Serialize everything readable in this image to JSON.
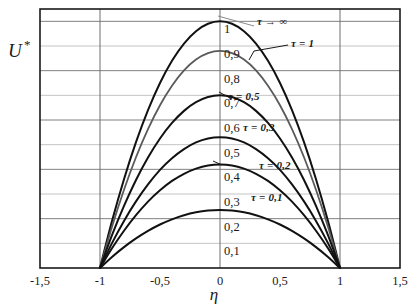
{
  "chart_data": {
    "type": "line",
    "title": "",
    "xlabel": "η",
    "ylabel": "U*",
    "xlim": [
      -1.5,
      1.5
    ],
    "ylim": [
      0,
      1.05
    ],
    "grid": true,
    "grid_x_values": [
      -1,
      0,
      1
    ],
    "grid_y_values": [
      0.1,
      0.2,
      0.3,
      0.4,
      0.5,
      0.6,
      0.7,
      0.8,
      0.9,
      1.0
    ],
    "xticks": [
      -1.5,
      -1,
      -0.5,
      0,
      0.5,
      1,
      1.5
    ],
    "xticklabels": [
      "-1,5",
      "-1",
      "-0,5",
      "0",
      "0,5",
      "1",
      "1,5"
    ],
    "yticks": [
      0.1,
      0.2,
      0.3,
      0.4,
      0.5,
      0.6,
      0.7,
      0.8,
      0.9,
      1.0
    ],
    "yticklabels": [
      "0,1",
      "0,2",
      "0,3",
      "0,4",
      "0,5",
      "0,6",
      "0,7",
      "0,8",
      "0,9",
      "1"
    ],
    "ytick_position": "inside-center",
    "legend_position": "inline-annotations",
    "series": [
      {
        "name": "τ → ∞",
        "label": "τ → ∞",
        "peak": 1.0,
        "color": "#111111",
        "width": 2.0,
        "x": [
          -1,
          -0.9,
          -0.8,
          -0.7,
          -0.6,
          -0.5,
          -0.4,
          -0.3,
          -0.2,
          -0.1,
          0,
          0.1,
          0.2,
          0.3,
          0.4,
          0.5,
          0.6,
          0.7,
          0.8,
          0.9,
          1
        ],
        "values": [
          0,
          0.19,
          0.36,
          0.51,
          0.64,
          0.75,
          0.84,
          0.91,
          0.96,
          0.99,
          1.0,
          0.99,
          0.96,
          0.91,
          0.84,
          0.75,
          0.64,
          0.51,
          0.36,
          0.19,
          0
        ]
      },
      {
        "name": "τ = 1",
        "label": "τ = 1",
        "peak": 0.88,
        "color": "#5a5a5a",
        "width": 1.8,
        "x": [
          -1,
          -0.9,
          -0.8,
          -0.7,
          -0.6,
          -0.5,
          -0.4,
          -0.3,
          -0.2,
          -0.1,
          0,
          0.1,
          0.2,
          0.3,
          0.4,
          0.5,
          0.6,
          0.7,
          0.8,
          0.9,
          1
        ],
        "values": [
          0,
          0.167,
          0.317,
          0.449,
          0.563,
          0.66,
          0.739,
          0.801,
          0.845,
          0.871,
          0.88,
          0.871,
          0.845,
          0.801,
          0.739,
          0.66,
          0.563,
          0.449,
          0.317,
          0.167,
          0
        ]
      },
      {
        "name": "τ = 0,5",
        "label": "τ = 0,5",
        "peak": 0.7,
        "color": "#111111",
        "width": 2.0,
        "x": [
          -1,
          -0.9,
          -0.8,
          -0.7,
          -0.6,
          -0.5,
          -0.4,
          -0.3,
          -0.2,
          -0.1,
          0,
          0.1,
          0.2,
          0.3,
          0.4,
          0.5,
          0.6,
          0.7,
          0.8,
          0.9,
          1
        ],
        "values": [
          0,
          0.133,
          0.252,
          0.357,
          0.448,
          0.525,
          0.588,
          0.637,
          0.672,
          0.693,
          0.7,
          0.693,
          0.672,
          0.637,
          0.588,
          0.525,
          0.448,
          0.357,
          0.252,
          0.133,
          0
        ]
      },
      {
        "name": "τ = 0,3",
        "label": "τ = 0,3",
        "peak": 0.53,
        "color": "#111111",
        "width": 2.0,
        "x": [
          -1,
          -0.9,
          -0.8,
          -0.7,
          -0.6,
          -0.5,
          -0.4,
          -0.3,
          -0.2,
          -0.1,
          0,
          0.1,
          0.2,
          0.3,
          0.4,
          0.5,
          0.6,
          0.7,
          0.8,
          0.9,
          1
        ],
        "values": [
          0,
          0.101,
          0.191,
          0.27,
          0.339,
          0.398,
          0.445,
          0.482,
          0.509,
          0.525,
          0.53,
          0.525,
          0.509,
          0.482,
          0.445,
          0.398,
          0.339,
          0.27,
          0.191,
          0.101,
          0
        ]
      },
      {
        "name": "τ = 0,2",
        "label": "τ = 0,2",
        "peak": 0.42,
        "color": "#111111",
        "width": 2.0,
        "x": [
          -1,
          -0.9,
          -0.8,
          -0.7,
          -0.6,
          -0.5,
          -0.4,
          -0.3,
          -0.2,
          -0.1,
          0,
          0.1,
          0.2,
          0.3,
          0.4,
          0.5,
          0.6,
          0.7,
          0.8,
          0.9,
          1
        ],
        "values": [
          0,
          0.08,
          0.151,
          0.214,
          0.269,
          0.315,
          0.353,
          0.382,
          0.403,
          0.416,
          0.42,
          0.416,
          0.403,
          0.382,
          0.353,
          0.315,
          0.269,
          0.214,
          0.151,
          0.08,
          0
        ]
      },
      {
        "name": "τ = 0,1",
        "label": "τ = 0,1",
        "peak": 0.235,
        "color": "#111111",
        "width": 2.0,
        "x": [
          -1,
          -0.9,
          -0.8,
          -0.7,
          -0.6,
          -0.5,
          -0.4,
          -0.3,
          -0.2,
          -0.1,
          0,
          0.1,
          0.2,
          0.3,
          0.4,
          0.5,
          0.6,
          0.7,
          0.8,
          0.9,
          1
        ],
        "values": [
          0,
          0.0447,
          0.0846,
          0.1198,
          0.1504,
          0.1763,
          0.1974,
          0.2139,
          0.2256,
          0.2327,
          0.235,
          0.2327,
          0.2256,
          0.2139,
          0.1974,
          0.1763,
          0.1504,
          0.1198,
          0.0846,
          0.0447,
          0
        ]
      }
    ],
    "annotations": [
      {
        "text": "τ → ∞",
        "x": 257,
        "y": 25,
        "leader": true
      },
      {
        "text": "τ = 1",
        "x": 291,
        "y": 47,
        "leader": true
      },
      {
        "text": "τ = 0,5",
        "x": 228,
        "y": 100,
        "leader": false
      },
      {
        "text": "τ = 0,3",
        "x": 243,
        "y": 131,
        "leader": false
      },
      {
        "text": "τ = 0,2",
        "x": 259,
        "y": 169,
        "leader": false
      },
      {
        "text": "τ = 0,1",
        "x": 251,
        "y": 201,
        "leader": false
      }
    ]
  },
  "axis": {
    "y_axis_label": "U",
    "y_axis_label_superscript": "*",
    "x_axis_label": "η"
  }
}
